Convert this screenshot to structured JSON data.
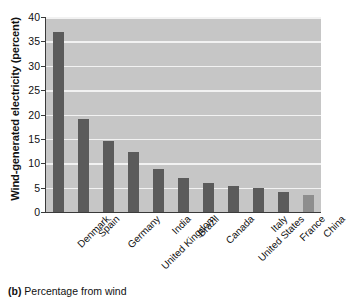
{
  "chart_data": {
    "type": "bar",
    "title": "",
    "xlabel": "",
    "ylabel": "Wind-generated electricity (percent)",
    "ylim": [
      0,
      40
    ],
    "ytick_step": 5,
    "grid": true,
    "legend": "none",
    "categories": [
      "Denmark",
      "Spain",
      "Germany",
      "United Kingdom",
      "India",
      "Brazil",
      "Canada",
      "United States",
      "Italy",
      "France",
      "China"
    ],
    "values": [
      37.0,
      19.0,
      14.6,
      12.4,
      8.9,
      7.0,
      5.9,
      5.3,
      4.9,
      4.2,
      3.5
    ],
    "ytick_labels": [
      "40",
      "35",
      "30",
      "25",
      "20",
      "15",
      "10",
      "5",
      "0"
    ],
    "ytick_values": [
      40,
      35,
      30,
      25,
      20,
      15,
      10,
      5,
      0
    ],
    "bar_colors": [
      "#5b5b5b",
      "#5b5b5b",
      "#5b5b5b",
      "#5b5b5b",
      "#5b5b5b",
      "#5b5b5b",
      "#5b5b5b",
      "#5b5b5b",
      "#5b5b5b",
      "#5b5b5b",
      "#8e8e8e"
    ],
    "plot_background": "#c6c6c6",
    "gridline_color": "#f2f2f2",
    "axis_color": "#3a3a3a"
  },
  "caption": {
    "label": "(b)",
    "text": " Percentage from wind"
  }
}
